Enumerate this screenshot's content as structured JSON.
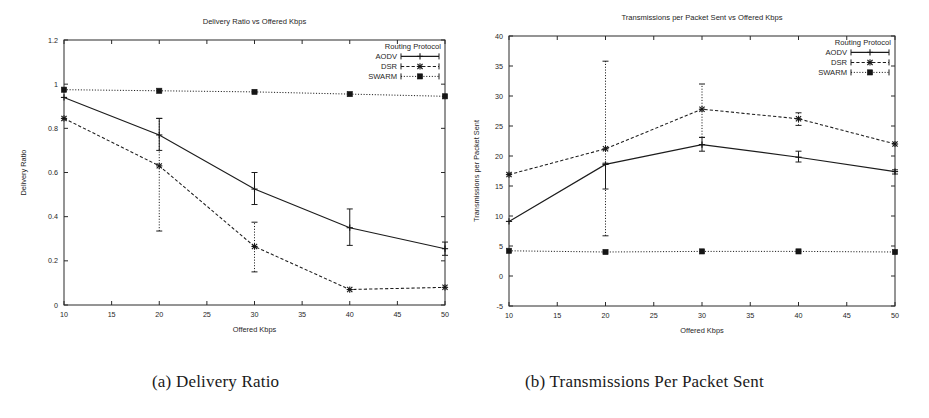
{
  "figure": {
    "captions": [
      {
        "id": "a",
        "text": "(a) Delivery Ratio"
      },
      {
        "id": "b",
        "text": "(b) Transmissions Per Packet Sent"
      }
    ]
  },
  "legend": {
    "title": "Routing Protocol",
    "entries": [
      "AODV",
      "DSR",
      "SWARM"
    ]
  },
  "colors": {
    "ink": "#1c1c1c",
    "axis": "#2a2a2a",
    "background": "#ffffff"
  },
  "chart_data": [
    {
      "type": "line",
      "title": "Delivery Ratio vs Offered Kbps",
      "xlabel": "Offered Kbps",
      "ylabel": "Delivery Ratio",
      "xlim": [
        10,
        50
      ],
      "ylim": [
        0,
        1.2
      ],
      "xticks": [
        10,
        15,
        20,
        25,
        30,
        35,
        40,
        45,
        50
      ],
      "yticks": [
        0,
        0.2,
        0.4,
        0.6,
        0.8,
        1,
        1.2
      ],
      "ytick_labels": [
        "0",
        "0.2",
        "0.4",
        "0.6",
        "0.8",
        "1",
        "1.2"
      ],
      "xtick_labels": [
        "10",
        "15",
        "20",
        "25",
        "30",
        "35",
        "40",
        "45",
        "50"
      ],
      "grid": false,
      "legend_position": "top-right",
      "legend_title": "Routing Protocol",
      "x": [
        10,
        20,
        30,
        40,
        50
      ],
      "series": [
        {
          "name": "AODV",
          "style": "solid",
          "marker": "plus",
          "values": [
            0.94,
            0.77,
            0.525,
            0.35,
            0.255
          ],
          "err_low": [
            0.94,
            0.7,
            0.455,
            0.27,
            0.225
          ],
          "err_high": [
            0.94,
            0.845,
            0.6,
            0.435,
            0.285
          ]
        },
        {
          "name": "DSR",
          "style": "dashed",
          "marker": "cross",
          "values": [
            0.845,
            0.63,
            0.265,
            0.07,
            0.08
          ],
          "err_low": [
            0.845,
            0.335,
            0.15,
            0.07,
            0.08
          ],
          "err_high": [
            0.845,
            0.845,
            0.375,
            0.07,
            0.08
          ]
        },
        {
          "name": "SWARM",
          "style": "dotted",
          "marker": "square",
          "values": [
            0.975,
            0.97,
            0.965,
            0.955,
            0.945
          ],
          "err_low": [
            0.975,
            0.97,
            0.965,
            0.955,
            0.945
          ],
          "err_high": [
            0.975,
            0.97,
            0.965,
            0.955,
            0.945
          ]
        }
      ]
    },
    {
      "type": "line",
      "title": "Transmissions per Packet Sent vs Offered Kbps",
      "xlabel": "Offered Kbps",
      "ylabel": "Transmissions per Packet Sent",
      "xlim": [
        10,
        50
      ],
      "ylim": [
        -5,
        40
      ],
      "xticks": [
        10,
        15,
        20,
        25,
        30,
        35,
        40,
        45,
        50
      ],
      "yticks": [
        -5,
        0,
        5,
        10,
        15,
        20,
        25,
        30,
        35,
        40
      ],
      "ytick_labels": [
        "-5",
        "0",
        "5",
        "10",
        "15",
        "20",
        "25",
        "30",
        "35",
        "40"
      ],
      "xtick_labels": [
        "10",
        "15",
        "20",
        "25",
        "30",
        "35",
        "40",
        "45",
        "50"
      ],
      "grid": false,
      "legend_position": "top-right",
      "legend_title": "Routing Protocol",
      "x": [
        10,
        20,
        30,
        40,
        50
      ],
      "series": [
        {
          "name": "AODV",
          "style": "solid",
          "marker": "plus",
          "values": [
            9.1,
            18.6,
            21.9,
            19.8,
            17.4
          ],
          "err_low": [
            9.1,
            14.5,
            20.8,
            19.0,
            17.0
          ],
          "err_high": [
            9.1,
            18.8,
            23.1,
            20.8,
            17.7
          ]
        },
        {
          "name": "DSR",
          "style": "dashed",
          "marker": "cross",
          "values": [
            16.9,
            21.2,
            27.8,
            26.2,
            22.0
          ],
          "err_low": [
            16.9,
            6.7,
            23.1,
            25.1,
            22.0
          ],
          "err_high": [
            16.9,
            35.8,
            32.0,
            27.2,
            22.0
          ]
        },
        {
          "name": "SWARM",
          "style": "dotted",
          "marker": "square",
          "values": [
            4.2,
            4.0,
            4.1,
            4.1,
            4.0
          ],
          "err_low": [
            4.2,
            4.0,
            4.1,
            4.1,
            4.0
          ],
          "err_high": [
            4.2,
            4.0,
            4.1,
            4.1,
            4.0
          ]
        }
      ]
    }
  ]
}
